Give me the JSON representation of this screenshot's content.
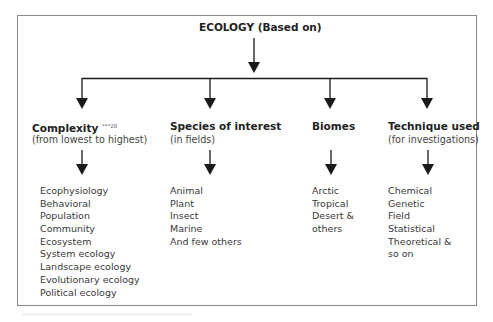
{
  "diagram": {
    "root": {
      "label": "ECOLOGY",
      "suffix": "(Based on)"
    },
    "branches": [
      {
        "title": "Complexity",
        "superscript": "***28",
        "subtitle": "(from lowest to highest)",
        "items": [
          "Ecophysiology",
          "Behavioral",
          "Population",
          "Community",
          "Ecosystem",
          "System ecology",
          "Landscape ecology",
          "Evolutionary ecology",
          "Political ecology"
        ]
      },
      {
        "title": "Species of interest",
        "subtitle": "(in fields)",
        "items": [
          "Animal",
          "Plant",
          "Insect",
          "Marine",
          "And few others"
        ]
      },
      {
        "title": "Biomes",
        "subtitle": "",
        "items": [
          "Arctic",
          "Tropical",
          "Desert &",
          "others"
        ]
      },
      {
        "title": "Technique used",
        "subtitle": "(for investigations)",
        "items": [
          "Chemical",
          "Genetic",
          "Field",
          "Statistical",
          "Theoretical &",
          "so on"
        ]
      }
    ],
    "colors": {
      "line": "#1a1a1a",
      "frame": "#8a8a8a",
      "text": "#2a2a2a"
    }
  }
}
